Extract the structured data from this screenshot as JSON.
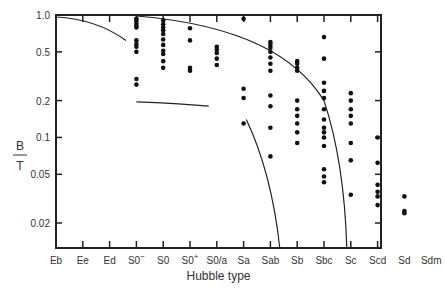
{
  "chart_data": {
    "type": "scatter",
    "title": "",
    "xlabel": "Hubble type",
    "ylabel_num": "B",
    "ylabel_den": "T",
    "yscale": "log",
    "ylim": [
      0.0125,
      1.0
    ],
    "yticks": [
      1.0,
      0.5,
      0.2,
      0.1,
      0.05,
      0.02
    ],
    "ytick_labels": [
      "1.0",
      "0.5",
      "0.2",
      "0.1",
      "0.05",
      "0.02"
    ],
    "categories": [
      "Eb",
      "Ee",
      "Ed",
      "S0−",
      "S0",
      "S0+",
      "S0/a",
      "Sa",
      "Sab",
      "Sb",
      "Sbc",
      "Sc",
      "Scd",
      "Sd",
      "Sdm"
    ],
    "points": {
      "S0−": [
        0.93,
        0.9,
        0.86,
        0.82,
        0.79,
        0.62,
        0.58,
        0.55,
        0.5,
        0.3,
        0.27
      ],
      "S0": [
        0.9,
        0.84,
        0.79,
        0.75,
        0.7,
        0.63,
        0.57,
        0.51,
        0.48,
        0.42,
        0.37
      ],
      "S0+": [
        0.78,
        0.62,
        0.37,
        0.35
      ],
      "S0/a": [
        0.55,
        0.52,
        0.49,
        0.44,
        0.39
      ],
      "Sa": [
        0.93,
        0.25,
        0.21,
        0.13
      ],
      "Sab": [
        0.6,
        0.57,
        0.54,
        0.5,
        0.45,
        0.4,
        0.35,
        0.22,
        0.18,
        0.12,
        0.07
      ],
      "Sb": [
        0.42,
        0.4,
        0.37,
        0.35,
        0.2,
        0.17,
        0.15,
        0.13,
        0.11,
        0.09
      ],
      "Sbc": [
        0.66,
        0.44,
        0.28,
        0.24,
        0.21,
        0.17,
        0.14,
        0.12,
        0.11,
        0.1,
        0.085,
        0.055,
        0.048,
        0.043
      ],
      "Sc": [
        0.23,
        0.2,
        0.17,
        0.15,
        0.13,
        0.09,
        0.065,
        0.034
      ],
      "Scd": [
        0.1,
        0.062,
        0.041,
        0.036,
        0.033,
        0.028
      ],
      "Sd": [
        0.033,
        0.025,
        0.024
      ]
    },
    "curves": [
      {
        "name": "upper-left-curve"
      },
      {
        "name": "upper-main-curve"
      },
      {
        "name": "lower-flat-curve"
      },
      {
        "name": "steep-curve-sab"
      }
    ],
    "legend": null,
    "grid": false
  }
}
